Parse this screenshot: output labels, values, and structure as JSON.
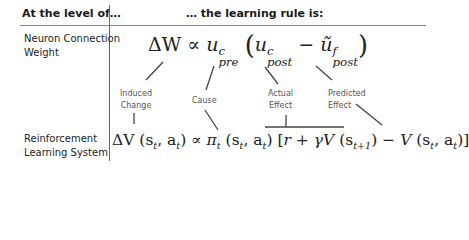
{
  "header": {
    "col1": "At the level of…",
    "col2": "… the learning rule is:"
  },
  "rows": [
    {
      "label_line1": "Neuron Connection",
      "label_line2": "Weight",
      "equation": {
        "delta": "ΔW",
        "propto": "∝",
        "cause_base": "u",
        "cause_sup": "c",
        "cause_sub": "pre",
        "open": "(",
        "actual_base": "u",
        "actual_sup": "c",
        "actual_sub": "post",
        "minus": "−",
        "pred_base": "ũ",
        "pred_sup": "f",
        "pred_sub": "post",
        "close": ")"
      }
    },
    {
      "label_line1": "Reinforcement",
      "label_line2": "Learning System",
      "equation": {
        "delta": "ΔV",
        "args1": "(s",
        "args1_sub": "t",
        "args1b": ", a",
        "args1b_sub": "t",
        "args1_close": ")",
        "propto": "∝",
        "pi": "π",
        "pi_sub": "t",
        "args2": "(s",
        "args2_sub": "t",
        "args2b": ", a",
        "args2b_sub": "t",
        "args2_close": ")",
        "bracket_open": "[",
        "r": "r",
        "plus": "+",
        "gamma_v": "γV",
        "next_state": "(s",
        "next_state_sub": "t+1",
        "next_state_close": ")",
        "minus": "−",
        "v": "V",
        "args3": "(s",
        "args3_sub": "t",
        "args3b": ", a",
        "args3b_sub": "t",
        "args3_close": ")",
        "bracket_close": "]"
      }
    }
  ],
  "annotations": {
    "induced_change": [
      "Induced",
      "Change"
    ],
    "cause": [
      "Cause"
    ],
    "actual_effect": [
      "Actual",
      "Effect"
    ],
    "predicted_effect": [
      "Predicted",
      "Effect"
    ]
  }
}
